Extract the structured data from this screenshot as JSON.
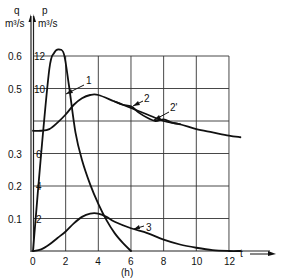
{
  "chart_data": {
    "type": "line",
    "title": "",
    "xlabel": "(h)",
    "x_axis_symbol": "t",
    "xlim": [
      0,
      12
    ],
    "x_ticks": [
      0,
      2,
      4,
      6,
      8,
      10,
      12
    ],
    "y_axes": {
      "left": {
        "symbol": "q",
        "unit": "m³/s",
        "ticks": [
          "0.1",
          "0.2",
          "0.3",
          "0.5",
          "0.6"
        ],
        "tick_values": [
          0.1,
          0.2,
          0.3,
          0.5,
          0.6
        ]
      },
      "right": {
        "symbol": "p",
        "unit": "m³/s",
        "ticks": [
          "2",
          "4",
          "6",
          "10",
          "12"
        ],
        "tick_values": [
          2,
          4,
          6,
          10,
          12
        ]
      }
    },
    "ylim_P": [
      0,
      12
    ],
    "grid": true,
    "series": [
      {
        "name": "1",
        "x": [
          0,
          0.5,
          1.0,
          1.3,
          1.6,
          1.9,
          2.2,
          2.6,
          3.0,
          3.5,
          4.0,
          4.5,
          5.0,
          5.5,
          6.0
        ],
        "y": [
          0,
          6.0,
          11.2,
          12.2,
          12.4,
          12.1,
          10.2,
          7.3,
          5.6,
          4.1,
          2.9,
          1.9,
          1.1,
          0.5,
          0
        ]
      },
      {
        "name": "2",
        "x": [
          0,
          0.5,
          1.0,
          1.5,
          2.0,
          2.5,
          3.0,
          3.5,
          4.0,
          5.0,
          6.0,
          7.0,
          8.0,
          9.0,
          10.0,
          11.0,
          12.0,
          12.7
        ],
        "y": [
          7.4,
          7.4,
          7.5,
          7.9,
          8.4,
          9.0,
          9.4,
          9.6,
          9.6,
          9.2,
          8.8,
          8.4,
          8.0,
          7.8,
          7.5,
          7.3,
          7.1,
          7.0
        ]
      },
      {
        "name": "2'",
        "x": [
          5.0,
          5.5,
          6.0,
          6.5,
          7.0,
          7.5,
          8.0,
          8.5,
          9.0
        ],
        "y": [
          9.2,
          9.0,
          8.9,
          8.5,
          8.2,
          8.0,
          8.1,
          7.9,
          7.8
        ]
      },
      {
        "name": "3",
        "x": [
          0,
          0.5,
          1.0,
          1.5,
          2.0,
          2.5,
          3.0,
          3.5,
          4.0,
          4.5,
          5.0,
          6.0,
          7.0,
          8.0,
          9.0,
          10.0,
          11.0,
          12.0,
          12.7
        ],
        "y": [
          0,
          0.1,
          0.4,
          0.8,
          1.2,
          1.7,
          2.1,
          2.3,
          2.3,
          2.1,
          1.8,
          1.4,
          1.1,
          0.7,
          0.4,
          0.2,
          0.05,
          0,
          0
        ]
      }
    ],
    "curve_labels": [
      "1",
      "2",
      "2'",
      "3"
    ]
  }
}
